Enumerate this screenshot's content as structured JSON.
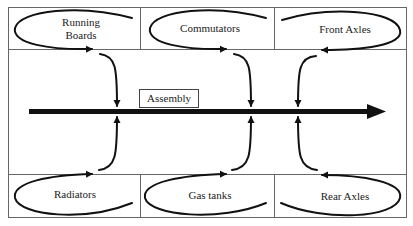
{
  "diagram": {
    "type": "assembly-line-flow",
    "center": {
      "label": "Assembly"
    },
    "top_row": [
      {
        "label": "Running Boards",
        "line1": "Running",
        "line2": "Boards"
      },
      {
        "label": "Commutators"
      },
      {
        "label": "Front Axles"
      }
    ],
    "bottom_row": [
      {
        "label": "Radiators"
      },
      {
        "label": "Gas tanks"
      },
      {
        "label": "Rear Axles"
      }
    ],
    "colors": {
      "line": "#111111",
      "border": "#666666",
      "background": "#ffffff"
    }
  }
}
